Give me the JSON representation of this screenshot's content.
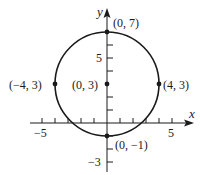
{
  "diagram": {
    "axes": {
      "x_label": "x",
      "y_label": "y",
      "x_ticks": [
        -5,
        -4,
        -3,
        -2,
        -1,
        1,
        2,
        3,
        4,
        5
      ],
      "y_ticks": [
        -3,
        -2,
        -1,
        1,
        2,
        3,
        4,
        5,
        6,
        7
      ],
      "x_tick_labels": [
        {
          "value": -5,
          "text": "−5"
        },
        {
          "value": 5,
          "text": "5"
        }
      ],
      "y_tick_labels": [
        {
          "value": 5,
          "text": "5"
        },
        {
          "value": -3,
          "text": "−3"
        }
      ]
    },
    "circle": {
      "center": [
        0,
        3
      ],
      "radius": 4
    },
    "points": [
      {
        "name": "top",
        "x": 0,
        "y": 7,
        "label": "(0, 7)"
      },
      {
        "name": "center",
        "x": 0,
        "y": 3,
        "label": "(0, 3)"
      },
      {
        "name": "left",
        "x": -4,
        "y": 3,
        "label": "(−4, 3)"
      },
      {
        "name": "right",
        "x": 4,
        "y": 3,
        "label": "(4, 3)"
      },
      {
        "name": "bottom",
        "x": 0,
        "y": -1,
        "label": "(0, −1)"
      }
    ],
    "colors": {
      "stroke": "#1a1a1a",
      "background": "#ffffff"
    }
  }
}
